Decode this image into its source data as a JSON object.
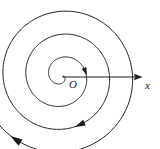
{
  "figure": {
    "kind": "archimedean-spiral-diagram",
    "background_color": "#ffffff",
    "stroke_color": "#1a1a1a",
    "labels": {
      "origin": "O",
      "x_axis": "x"
    },
    "axis": {
      "name": "polar-axis",
      "from_x": 62,
      "from_y": 77,
      "to_x": 142,
      "to_y": 77,
      "arrow": "right"
    },
    "pole": {
      "x": 62,
      "y": 76
    },
    "direction_arrows": [
      {
        "name": "inner-spiral-arrow",
        "x": 62,
        "y": 85,
        "angle_deg": 10
      },
      {
        "name": "middle-spiral-arrow",
        "x": 26,
        "y": 48,
        "angle_deg": 222
      },
      {
        "name": "outer-spiral-arrow",
        "x": 123,
        "y": 17,
        "angle_deg": 70
      }
    ],
    "spiral": {
      "type": "archimedean",
      "turns": 3.4,
      "growth_per_turn_px": 23,
      "sweep": "clockwise-outward",
      "start_radius_px": 1.5,
      "end_radius_px": 80
    }
  }
}
